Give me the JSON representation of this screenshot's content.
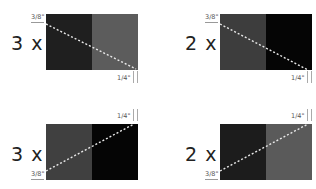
{
  "panels": [
    {
      "id": "top-left",
      "multiplier": "3 x",
      "left_color": "#1f1f1f",
      "right_color": "#5c5c5c",
      "start_label": "3/8\"",
      "end_label": "1/4\"",
      "direction": "descending"
    },
    {
      "id": "top-right",
      "multiplier": "2 x",
      "left_color": "#3d3d3d",
      "right_color": "#050505",
      "start_label": "3/8\"",
      "end_label": "1/4\"",
      "direction": "descending"
    },
    {
      "id": "bottom-left",
      "multiplier": "3 x",
      "left_color": "#404040",
      "right_color": "#050505",
      "start_label": "3/8\"",
      "end_label": "1/4\"",
      "direction": "ascending"
    },
    {
      "id": "bottom-right",
      "multiplier": "2 x",
      "left_color": "#1c1c1c",
      "right_color": "#5a5a5a",
      "start_label": "3/8\"",
      "end_label": "1/4\"",
      "direction": "ascending"
    }
  ],
  "colors": {
    "dashed_line": "#e8e8e8",
    "text": "#222222",
    "dimension_text": "#555555"
  }
}
